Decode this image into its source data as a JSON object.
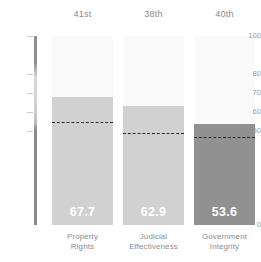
{
  "chart_data": {
    "type": "bar",
    "title": "",
    "subtitle": "",
    "xlabel": "",
    "ylabel": "",
    "ylim": [
      0,
      100
    ],
    "grid": false,
    "legend_position": "none",
    "categories": [
      "Property Rights",
      "Judicial Effectiveness",
      "Government Integrity"
    ],
    "category_lines": [
      [
        "Property",
        "Rights"
      ],
      [
        "Judicial",
        "Effectiveness"
      ],
      [
        "Government",
        "Integrity"
      ]
    ],
    "values": [
      67.7,
      62.9,
      53.6
    ],
    "value_labels": [
      "67.7",
      "62.9",
      "53.6"
    ],
    "ranks": [
      "41st",
      "38th",
      "40th"
    ],
    "reference_lines": [
      54.5,
      48.5,
      46.5
    ],
    "yticks": [
      0,
      50,
      60,
      70,
      80,
      100
    ],
    "ytick_labels": [
      "0",
      "50",
      "60",
      "70",
      "80",
      "100"
    ],
    "bar_colors": [
      "#d1d1d1",
      "#d1d1d1",
      "#919191"
    ],
    "reference_line_color": "#2b2b2b",
    "value_label_color": "#ffffff",
    "panel_color": "#fafafa",
    "axis_label_color": "#9a9a9a",
    "background_color": "#ffffff"
  }
}
